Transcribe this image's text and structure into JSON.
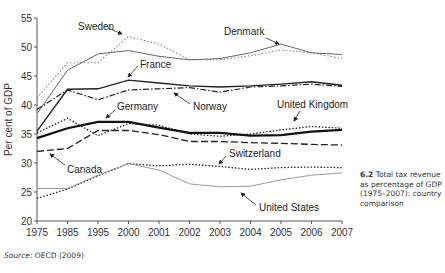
{
  "chart_data": {
    "type": "line",
    "title": "",
    "xlabel": "",
    "ylabel": "Per cent of GDP",
    "ylim": [
      20,
      55
    ],
    "yticks": [
      20,
      25,
      30,
      35,
      40,
      45,
      50,
      55
    ],
    "grid": false,
    "categories": [
      "1975",
      "1985",
      "1995",
      "2000",
      "2001",
      "2002",
      "2003",
      "2004",
      "2005",
      "2006",
      "2007"
    ],
    "series": [
      {
        "name": "Sweden",
        "style": "dotted-gray",
        "values": [
          41.2,
          47.3,
          47.3,
          51.8,
          50.5,
          47.8,
          47.8,
          48.5,
          49.5,
          49.0,
          48.0
        ]
      },
      {
        "name": "Denmark",
        "style": "solid-gray",
        "values": [
          38.5,
          46.0,
          48.8,
          49.4,
          48.4,
          47.8,
          48.0,
          49.0,
          50.5,
          49.0,
          48.7
        ]
      },
      {
        "name": "France",
        "style": "solid-black",
        "values": [
          35.5,
          42.7,
          42.8,
          44.3,
          43.8,
          43.3,
          43.1,
          43.3,
          43.6,
          44.0,
          43.4
        ]
      },
      {
        "name": "Norway",
        "style": "dash-dot-black",
        "values": [
          39.2,
          42.6,
          40.9,
          42.6,
          42.8,
          43.0,
          42.2,
          43.1,
          43.3,
          43.6,
          43.2
        ]
      },
      {
        "name": "United Kingdom",
        "style": "dotted-black",
        "values": [
          35.2,
          37.7,
          34.7,
          36.8,
          36.5,
          35.0,
          34.6,
          35.0,
          35.7,
          36.3,
          36.0
        ]
      },
      {
        "name": "Germany",
        "style": "solid-black-thick",
        "values": [
          34.3,
          36.0,
          37.1,
          37.1,
          36.1,
          35.2,
          35.2,
          34.7,
          34.8,
          35.4,
          35.7
        ]
      },
      {
        "name": "Canada",
        "style": "long-dash-black",
        "values": [
          32.0,
          32.5,
          35.6,
          35.6,
          34.9,
          33.7,
          33.7,
          33.5,
          33.4,
          33.2,
          33.1
        ]
      },
      {
        "name": "Switzerland",
        "style": "dotted-black",
        "values": [
          23.9,
          25.5,
          27.8,
          29.9,
          29.5,
          29.8,
          29.4,
          28.9,
          29.2,
          29.3,
          29.2
        ]
      },
      {
        "name": "United States",
        "style": "solid-lightgray",
        "values": [
          25.6,
          25.6,
          27.9,
          29.9,
          28.8,
          26.4,
          25.9,
          26.0,
          27.1,
          27.9,
          28.3
        ]
      }
    ],
    "annotations": [
      "Sweden",
      "Denmark",
      "France",
      "Norway",
      "Germany",
      "United Kingdom",
      "Canada",
      "Switzerland",
      "United States"
    ]
  },
  "axis": {
    "ylabel": "Per cent of GDP",
    "yticks": [
      "20",
      "25",
      "30",
      "35",
      "40",
      "45",
      "50",
      "55"
    ],
    "xticks": [
      "1975",
      "1985",
      "1995",
      "2000",
      "2001",
      "2002",
      "2003",
      "2004",
      "2005",
      "2006",
      "2007"
    ]
  },
  "labels": {
    "sweden": "Sweden",
    "denmark": "Denmark",
    "france": "France",
    "norway": "Norway",
    "germany": "Germany",
    "uk": "United Kingdom",
    "canada": "Canada",
    "switzerland": "Switzerland",
    "us": "United States"
  },
  "caption": {
    "number": "6.2",
    "text": "Total tax revenue as percentage of GDP (1975–2007): country comparison"
  },
  "source": {
    "label": "Source",
    "text": ": OECD (2009)"
  }
}
